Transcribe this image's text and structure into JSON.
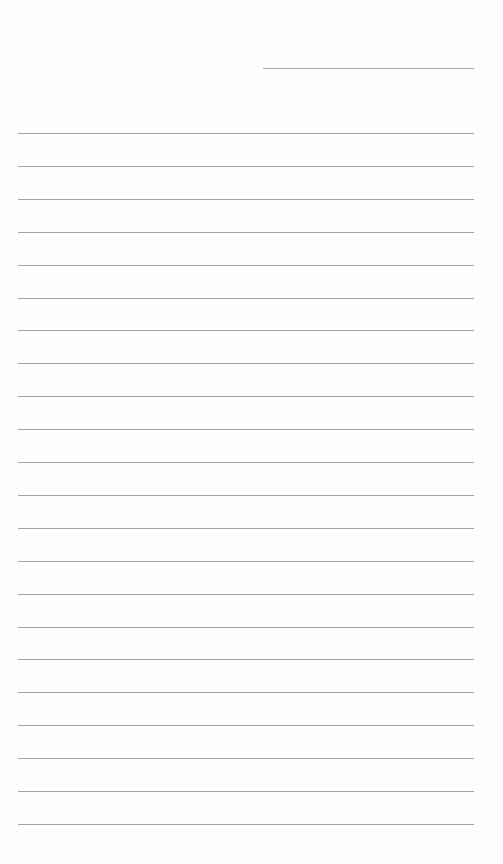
{
  "document": {
    "type": "lined-paper",
    "header_line": {
      "present": true
    },
    "ruled_line_count": 22,
    "line_color": "#a4a4a4",
    "background_color": "#fefefe"
  }
}
